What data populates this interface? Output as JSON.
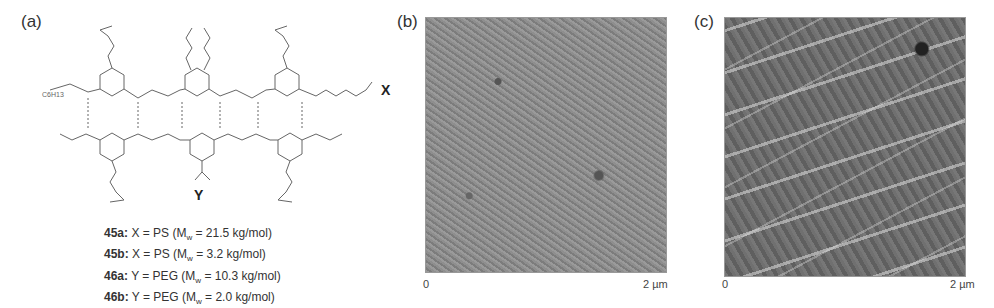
{
  "panels": {
    "a": {
      "label": "(a)"
    },
    "b": {
      "label": "(b)",
      "axis_start": "0",
      "axis_end": "2 µm"
    },
    "c": {
      "label": "(c)",
      "axis_start": "0",
      "axis_end": "2 µm"
    }
  },
  "structure": {
    "substituent_x": "X",
    "substituent_y": "Y",
    "alkyl_label": "C6H13"
  },
  "compounds": [
    {
      "id": "45a:",
      "text": "X = PS (M",
      "sub": "w",
      "rest": " = 21.5 kg/mol)"
    },
    {
      "id": "45b:",
      "text": "X = PS (M",
      "sub": "w",
      "rest": " = 3.2 kg/mol)"
    },
    {
      "id": "46a:",
      "text": "Y = PEG (M",
      "sub": "w",
      "rest": " = 10.3 kg/mol)"
    },
    {
      "id": "46b:",
      "text": "Y = PEG (M",
      "sub": "w",
      "rest": " = 2.0 kg/mol)"
    }
  ],
  "colors": {
    "afm_b_base": "#8a8a8a",
    "afm_c_base": "#6e6e6e"
  }
}
